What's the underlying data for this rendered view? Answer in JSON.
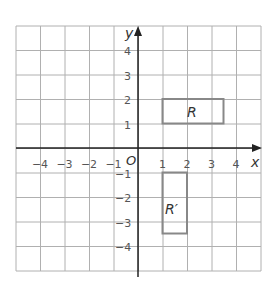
{
  "axes": {
    "x_label": "x",
    "y_label": "y",
    "origin_label": "O",
    "x_ticks": [
      "−4",
      "−3",
      "−2",
      "−1",
      "1",
      "2",
      "3",
      "4"
    ],
    "y_ticks": [
      "4",
      "3",
      "2",
      "1",
      "−1",
      "−2",
      "−3",
      "−4"
    ],
    "x_range": [
      -5,
      5
    ],
    "y_range": [
      -5,
      5
    ]
  },
  "shapes": {
    "R": {
      "label": "R",
      "x1": 1,
      "y1": 1,
      "x2": 3.5,
      "y2": 2
    },
    "R_prime": {
      "label": "R′",
      "x1": 1,
      "y1": -1,
      "x2": 2,
      "y2": -3.5
    }
  },
  "colors": {
    "grid": "#b0b0b0",
    "axis": "#222222",
    "shape": "#888888"
  }
}
